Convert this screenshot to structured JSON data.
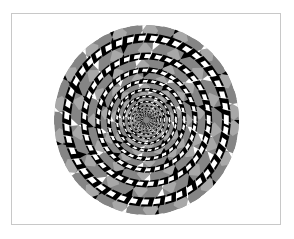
{
  "figure": {
    "frame_color": "#c8c8c8",
    "background_color": "#ffffff",
    "disc": {
      "cx": 146.5,
      "cy": 120,
      "rx": 92.5,
      "ry": 95,
      "base_color": "#808080"
    },
    "colors": {
      "gray": "#858585",
      "light_gray": "#a8a8a8",
      "black": "#000000",
      "white": "#ffffff"
    },
    "rings": 9,
    "segments_per_ring": 24,
    "cord_twist_deg": 18,
    "radius_ratio": 0.78
  }
}
